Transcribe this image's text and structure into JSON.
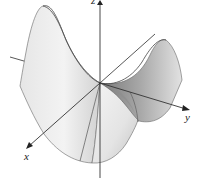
{
  "figure": {
    "axes": {
      "x": {
        "label": "x"
      },
      "y": {
        "label": "y"
      },
      "z": {
        "label": "z"
      }
    },
    "colors": {
      "background": "#ffffff",
      "axis": "#333333",
      "surface_light": "#f2f2f2",
      "surface_mid": "#c8c8c8",
      "surface_dark": "#6e6e6e",
      "edge": "#555555"
    }
  }
}
